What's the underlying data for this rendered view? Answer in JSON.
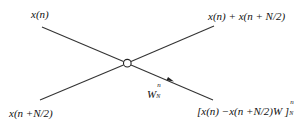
{
  "diagram": {
    "type": "butterfly",
    "title": "",
    "nodes": {
      "input_top": {
        "label": "x(n)"
      },
      "input_bottom": {
        "label": "x(n +N/2)"
      },
      "output_top": {
        "label": "x(n) + x(n + N/2)"
      },
      "output_bottom": {
        "label_main": "[x(n) −x(n +N/2)W ]",
        "label_sup": "n",
        "label_sub": "N"
      },
      "twiddle": {
        "label_main": "W",
        "label_sup": "n",
        "label_sub": "N"
      }
    },
    "edges": [
      {
        "from": "input_top",
        "to": "output_bottom",
        "via": "junction"
      },
      {
        "from": "input_bottom",
        "to": "output_top",
        "via": "junction"
      }
    ],
    "colors": {
      "line": "#333333",
      "text": "#111111",
      "background": "#ffffff"
    }
  }
}
